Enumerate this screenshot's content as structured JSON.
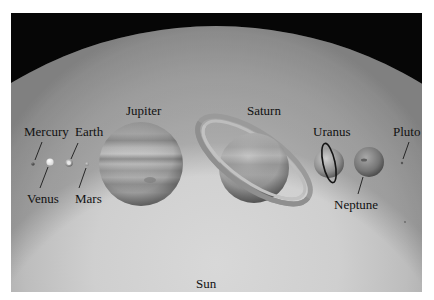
{
  "figure": {
    "background_color": "#060606",
    "sun_color": "#c8c8c8"
  },
  "labels": {
    "sun": "Sun",
    "mercury": "Mercury",
    "venus": "Venus",
    "earth": "Earth",
    "mars": "Mars",
    "jupiter": "Jupiter",
    "saturn": "Saturn",
    "uranus": "Uranus",
    "neptune": "Neptune",
    "pluto": "Pluto"
  },
  "bodies": [
    {
      "name": "Mercury",
      "cx": 33,
      "cy": 164,
      "r": 1.5
    },
    {
      "name": "Venus",
      "cx": 50,
      "cy": 162,
      "r": 3.5
    },
    {
      "name": "Earth",
      "cx": 69,
      "cy": 163,
      "r": 3.7
    },
    {
      "name": "Mars",
      "cx": 87,
      "cy": 164,
      "r": 2
    },
    {
      "name": "Jupiter",
      "cx": 141,
      "cy": 164,
      "r": 42
    },
    {
      "name": "Saturn",
      "cx": 254,
      "cy": 168,
      "r": 35
    },
    {
      "name": "Uranus",
      "cx": 329,
      "cy": 163,
      "r": 15
    },
    {
      "name": "Neptune",
      "cx": 369,
      "cy": 162,
      "r": 15
    },
    {
      "name": "Pluto",
      "cx": 402,
      "cy": 163,
      "r": 1
    }
  ]
}
